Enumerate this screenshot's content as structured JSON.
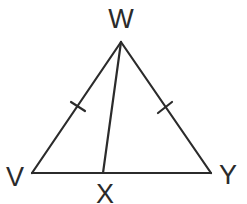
{
  "diagram": {
    "type": "triangle",
    "colors": {
      "stroke": "#2b2b2b",
      "text": "#2b2b2b",
      "background": "#ffffff"
    },
    "vertices": {
      "W": {
        "label": "W",
        "x": 121,
        "y": 42
      },
      "V": {
        "label": "V",
        "x": 32,
        "y": 173
      },
      "Y": {
        "label": "Y",
        "x": 211,
        "y": 173
      },
      "X": {
        "label": "X",
        "x": 103,
        "y": 173
      }
    },
    "segments": [
      {
        "from": "W",
        "to": "V",
        "congruence_ticks": 1
      },
      {
        "from": "W",
        "to": "Y",
        "congruence_ticks": 1
      },
      {
        "from": "V",
        "to": "Y",
        "congruence_ticks": 0
      },
      {
        "from": "W",
        "to": "X",
        "congruence_ticks": 0
      }
    ],
    "labels": {
      "W": "W",
      "V": "V",
      "Y": "Y",
      "X": "X"
    }
  }
}
